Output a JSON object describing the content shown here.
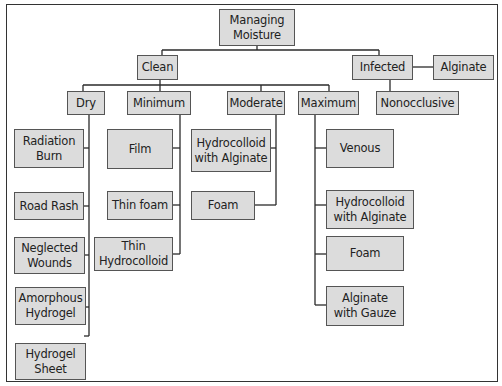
{
  "diagram": {
    "type": "tree",
    "title": "Managing Moisture",
    "nodes": {
      "root": "Managing\nMoisture",
      "clean": "Clean",
      "infected": "Infected",
      "alginate": "Alginate",
      "nonocclusive": "Nonocclusive",
      "dry": "Dry",
      "minimum": "Minimum",
      "moderate": "Moderate",
      "maximum": "Maximum",
      "dry_children": [
        "Radiation\nBurn",
        "Road Rash",
        "Neglected\nWounds",
        "Amorphous\nHydrogel",
        "Hydrogel\nSheet"
      ],
      "minimum_children": [
        "Film",
        "Thin foam",
        "Thin\nHydrocolloid"
      ],
      "moderate_children": [
        "Hydrocolloid\nwith Alginate",
        "Foam"
      ],
      "maximum_children": [
        "Venous",
        "Hydrocolloid\nwith Alginate",
        "Foam",
        "Alginate\nwith Gauze"
      ]
    },
    "edges": [
      [
        "Managing Moisture",
        "Clean"
      ],
      [
        "Managing Moisture",
        "Infected"
      ],
      [
        "Infected",
        "Alginate"
      ],
      [
        "Infected",
        "Nonocclusive"
      ],
      [
        "Clean",
        "Dry"
      ],
      [
        "Clean",
        "Minimum"
      ],
      [
        "Clean",
        "Moderate"
      ],
      [
        "Clean",
        "Maximum"
      ],
      [
        "Dry",
        "Radiation Burn"
      ],
      [
        "Dry",
        "Road Rash"
      ],
      [
        "Dry",
        "Neglected Wounds"
      ],
      [
        "Dry",
        "Amorphous Hydrogel"
      ],
      [
        "Dry",
        "Hydrogel Sheet"
      ],
      [
        "Minimum",
        "Film"
      ],
      [
        "Minimum",
        "Thin foam"
      ],
      [
        "Minimum",
        "Thin Hydrocolloid"
      ],
      [
        "Moderate",
        "Hydrocolloid with Alginate"
      ],
      [
        "Moderate",
        "Foam"
      ],
      [
        "Maximum",
        "Venous"
      ],
      [
        "Maximum",
        "Hydrocolloid with Alginate"
      ],
      [
        "Maximum",
        "Foam"
      ],
      [
        "Maximum",
        "Alginate with Gauze"
      ]
    ],
    "colors": {
      "node_fill": "#dcdcdc",
      "node_border": "#555555",
      "line": "#2a2a2a"
    }
  }
}
